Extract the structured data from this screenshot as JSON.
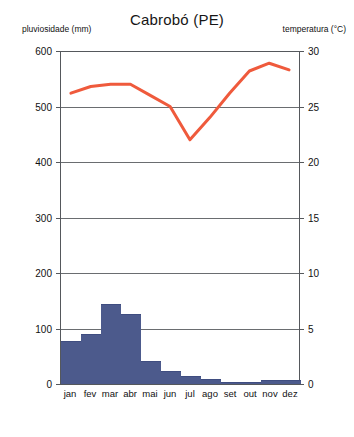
{
  "chart_data": {
    "type": "bar",
    "title": "Cabrobó (PE)",
    "xlabel": "",
    "ylabel": "pluviosidade (mm)",
    "y2label": "temperatura (°C)",
    "grid": true,
    "legend": "none",
    "categories": [
      "jan",
      "fev",
      "mar",
      "abr",
      "mai",
      "jun",
      "jul",
      "ago",
      "set",
      "out",
      "nov",
      "dez"
    ],
    "ylim": [
      0,
      600
    ],
    "yticks": [
      0,
      100,
      200,
      300,
      400,
      500,
      600
    ],
    "y2lim": [
      0,
      30
    ],
    "y2ticks": [
      0,
      5,
      10,
      15,
      20,
      25,
      30
    ],
    "series": [
      {
        "name": "pluviosidade (mm)",
        "type": "bar",
        "axis": "left",
        "color": "#4c5a8c",
        "values": [
          75,
          88,
          142,
          125,
          40,
          22,
          13,
          8,
          2,
          2,
          5,
          6
        ]
      },
      {
        "name": "temperatura (°C)",
        "type": "line",
        "axis": "right",
        "color": "#ef5a3c",
        "values": [
          26.2,
          26.8,
          27.0,
          27.0,
          26.0,
          25.0,
          22.0,
          24.0,
          26.2,
          28.2,
          28.9,
          28.3
        ]
      }
    ]
  },
  "header": {
    "left_axis_title": "pluviosidade (mm)",
    "title": "Cabrobó (PE)",
    "right_axis_title": "temperatura (°C)"
  },
  "colors": {
    "bar": "#4c5a8c",
    "line": "#ef5a3c",
    "axis": "#55585c",
    "grid": "#6a6d70",
    "background": "#ffffff"
  }
}
